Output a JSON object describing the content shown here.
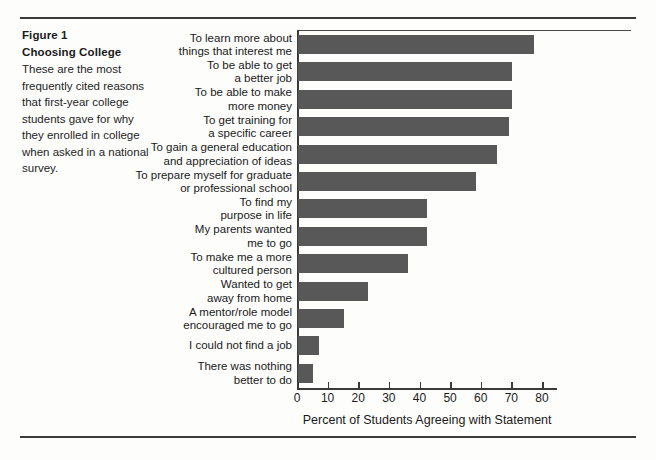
{
  "caption": {
    "figure_number": "Figure 1",
    "figure_title": "Choosing College",
    "description": "These are the most frequently cited reasons that first-year college students gave for why they enrolled in college when asked in a national survey."
  },
  "chart_data": {
    "type": "bar",
    "orientation": "horizontal",
    "title": "Choosing College",
    "xlabel": "Percent of Students Agreeing with Statement",
    "ylabel": "",
    "xlim": [
      0,
      85
    ],
    "xticks": [
      0,
      10,
      20,
      30,
      40,
      50,
      60,
      70,
      80
    ],
    "xticklabels": [
      "0",
      "10",
      "20",
      "30",
      "40",
      "50",
      "60",
      "70",
      "80"
    ],
    "grid": false,
    "legend": false,
    "bar_color": "#585858",
    "categories": [
      "To learn more about\nthings that interest me",
      "To be able to get\na better job",
      "To be able to make\nmore money",
      "To get training for\na specific career",
      "To gain a general education\nand appreciation of ideas",
      "To prepare myself for graduate\nor professional school",
      "To find my\npurpose in life",
      "My parents wanted\nme to go",
      "To make me a more\ncultured person",
      "Wanted to get\naway from home",
      "A mentor/role model\nencouraged me to go",
      "I could not find a job",
      "There was nothing\nbetter to do"
    ],
    "values": [
      77,
      70,
      70,
      69,
      65,
      58,
      42,
      42,
      36,
      23,
      15,
      7,
      5
    ]
  }
}
